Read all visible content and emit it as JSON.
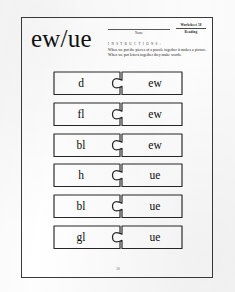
{
  "worksheet": {
    "title": "ew/ue",
    "name_label": "Name",
    "sheet_number": "Worksheet 58",
    "sheet_subject": "Reading",
    "instructions_heading": "I N S T R U C T I O N S :",
    "instructions_text": "When we put the pieces of a puzzle together it makes a picture. When we put letters together they make words.",
    "page_number": "58",
    "colors": {
      "ink": "#262626",
      "paper": "#ffffff",
      "border": "#3a3a3a"
    },
    "rows": [
      {
        "onset": "d",
        "rime": "ew",
        "word": "dew"
      },
      {
        "onset": "fl",
        "rime": "ew",
        "word": "flew"
      },
      {
        "onset": "bl",
        "rime": "ew",
        "word": "blew"
      },
      {
        "onset": "h",
        "rime": "ue",
        "word": "hue"
      },
      {
        "onset": "bl",
        "rime": "ue",
        "word": "blue"
      },
      {
        "onset": "gl",
        "rime": "ue",
        "word": "glue"
      }
    ]
  }
}
